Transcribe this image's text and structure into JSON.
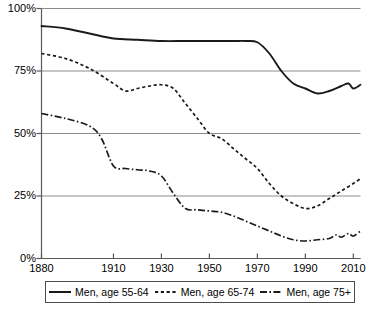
{
  "chart_data": {
    "type": "line",
    "title": "",
    "subtitle": "",
    "xlabel": "",
    "ylabel": "",
    "xlim": [
      1880,
      2013
    ],
    "ylim": [
      0,
      100
    ],
    "grid": true,
    "grid_axis": "y",
    "legend_position": "bottom",
    "y_ticks": [
      0,
      25,
      50,
      75,
      100
    ],
    "y_tick_labels": [
      "0%",
      "25%",
      "50%",
      "75%",
      "100%"
    ],
    "x_ticks": [
      1880,
      1910,
      1930,
      1950,
      1970,
      1990,
      2010
    ],
    "x_tick_labels": [
      "1880",
      "1910",
      "1930",
      "1950",
      "1970",
      "1990",
      "2010"
    ],
    "series": [
      {
        "name": "Men, age 55-64",
        "style": "solid",
        "color": "#1a1a1a",
        "x": [
          1880,
          1890,
          1900,
          1910,
          1920,
          1930,
          1940,
          1950,
          1960,
          1965,
          1970,
          1975,
          1980,
          1985,
          1990,
          1995,
          2000,
          2005,
          2008,
          2010,
          2013
        ],
        "values": [
          93,
          92,
          90,
          88,
          87.5,
          87,
          87,
          87,
          87,
          87,
          86.5,
          82,
          75,
          70,
          68,
          66,
          67,
          69,
          70,
          68,
          69.5
        ]
      },
      {
        "name": "Men, age 65-74",
        "style": "dashed",
        "color": "#1a1a1a",
        "x": [
          1880,
          1890,
          1900,
          1910,
          1915,
          1920,
          1925,
          1930,
          1935,
          1940,
          1945,
          1950,
          1955,
          1960,
          1965,
          1970,
          1975,
          1980,
          1985,
          1990,
          1995,
          2000,
          2005,
          2010,
          2013
        ],
        "values": [
          82,
          80,
          76,
          70,
          67,
          68,
          69,
          69.5,
          68,
          62,
          56,
          50,
          48,
          44,
          40,
          36,
          30,
          25,
          22,
          20,
          21,
          24,
          27,
          30,
          32
        ]
      },
      {
        "name": "Men, age 75+",
        "style": "dashdot",
        "color": "#1a1a1a",
        "x": [
          1880,
          1890,
          1900,
          1905,
          1910,
          1915,
          1920,
          1925,
          1930,
          1935,
          1940,
          1945,
          1950,
          1955,
          1960,
          1965,
          1970,
          1975,
          1980,
          1985,
          1990,
          1995,
          2000,
          2003,
          2005,
          2008,
          2010,
          2013
        ],
        "values": [
          58,
          56,
          53,
          48,
          37,
          36,
          35.5,
          35,
          33,
          26,
          20,
          19.5,
          19,
          18.5,
          17,
          15,
          13,
          11,
          9,
          7.5,
          7,
          7.5,
          8,
          9.5,
          8.5,
          10,
          9,
          11
        ]
      }
    ]
  },
  "axes": {
    "y_labels": [
      "100%",
      "75%",
      "50%",
      "25%",
      "0%"
    ],
    "x_labels": [
      "1880",
      "1910",
      "1930",
      "1950",
      "1970",
      "1990",
      "2010"
    ]
  },
  "legend": {
    "entries": [
      {
        "label": "Men, age 55-64",
        "style": "solid"
      },
      {
        "label": "Men, age 65-74",
        "style": "dashed"
      },
      {
        "label": "Men, age 75+",
        "style": "dashdot"
      }
    ]
  }
}
